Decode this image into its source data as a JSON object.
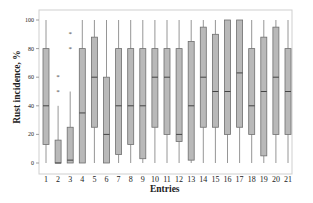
{
  "chart_data": {
    "type": "box",
    "title": "",
    "xlabel": "Entries",
    "ylabel": "Rust incidence, %",
    "ylim": [
      0,
      100
    ],
    "yticks": [
      0,
      20,
      40,
      60,
      80,
      100
    ],
    "grid": false,
    "legend": null,
    "categories": [
      "1",
      "2",
      "3",
      "4",
      "5",
      "6",
      "7",
      "8",
      "9",
      "10",
      "11",
      "12",
      "13",
      "14",
      "15",
      "16",
      "17",
      "18",
      "19",
      "20",
      "21"
    ],
    "boxes": [
      {
        "entry": "1",
        "min": 0,
        "q1": 13,
        "median": 40,
        "q3": 80,
        "max": 100,
        "outliers": []
      },
      {
        "entry": "2",
        "min": 0,
        "q1": 0,
        "median": 0,
        "q3": 16,
        "max": 40,
        "outliers": [
          50,
          60
        ]
      },
      {
        "entry": "3",
        "min": 0,
        "q1": 0,
        "median": 2,
        "q3": 25,
        "max": 50,
        "outliers": [
          80,
          90
        ]
      },
      {
        "entry": "4",
        "min": 0,
        "q1": 0,
        "median": 35,
        "q3": 80,
        "max": 100,
        "outliers": []
      },
      {
        "entry": "5",
        "min": 0,
        "q1": 25,
        "median": 60,
        "q3": 88,
        "max": 100,
        "outliers": []
      },
      {
        "entry": "6",
        "min": 0,
        "q1": 0,
        "median": 20,
        "q3": 60,
        "max": 100,
        "outliers": []
      },
      {
        "entry": "7",
        "min": 0,
        "q1": 6,
        "median": 40,
        "q3": 80,
        "max": 100,
        "outliers": []
      },
      {
        "entry": "8",
        "min": 0,
        "q1": 13,
        "median": 40,
        "q3": 80,
        "max": 100,
        "outliers": []
      },
      {
        "entry": "9",
        "min": 0,
        "q1": 3,
        "median": 40,
        "q3": 80,
        "max": 100,
        "outliers": []
      },
      {
        "entry": "10",
        "min": 0,
        "q1": 25,
        "median": 60,
        "q3": 80,
        "max": 100,
        "outliers": []
      },
      {
        "entry": "11",
        "min": 0,
        "q1": 20,
        "median": 60,
        "q3": 80,
        "max": 100,
        "outliers": []
      },
      {
        "entry": "12",
        "min": 0,
        "q1": 15,
        "median": 20,
        "q3": 80,
        "max": 100,
        "outliers": []
      },
      {
        "entry": "13",
        "min": 0,
        "q1": 2,
        "median": 40,
        "q3": 85,
        "max": 100,
        "outliers": []
      },
      {
        "entry": "14",
        "min": 0,
        "q1": 25,
        "median": 60,
        "q3": 95,
        "max": 100,
        "outliers": []
      },
      {
        "entry": "15",
        "min": 0,
        "q1": 25,
        "median": 50,
        "q3": 90,
        "max": 100,
        "outliers": []
      },
      {
        "entry": "16",
        "min": 0,
        "q1": 20,
        "median": 50,
        "q3": 100,
        "max": 100,
        "outliers": []
      },
      {
        "entry": "17",
        "min": 0,
        "q1": 25,
        "median": 63,
        "q3": 100,
        "max": 100,
        "outliers": []
      },
      {
        "entry": "18",
        "min": 0,
        "q1": 20,
        "median": 40,
        "q3": 80,
        "max": 100,
        "outliers": []
      },
      {
        "entry": "19",
        "min": 0,
        "q1": 5,
        "median": 50,
        "q3": 88,
        "max": 100,
        "outliers": []
      },
      {
        "entry": "20",
        "min": 0,
        "q1": 20,
        "median": 60,
        "q3": 95,
        "max": 100,
        "outliers": []
      },
      {
        "entry": "21",
        "min": 0,
        "q1": 20,
        "median": 50,
        "q3": 80,
        "max": 100,
        "outliers": []
      }
    ]
  },
  "colors": {
    "box_fill": "#b9b9b9",
    "box_stroke": "#6e6e6e",
    "whisker": "#8a8a8a",
    "frame": "#c8c8c8",
    "text": "#222222"
  }
}
